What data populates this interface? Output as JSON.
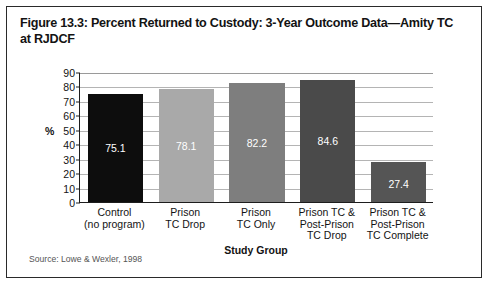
{
  "figure": {
    "title": "Figure 13.3: Percent Returned to Custody: 3-Year Outcome Data—Amity TC at RJDCF",
    "source_note": "Source: Lowe & Wexler, 1998"
  },
  "chart_data": {
    "type": "bar",
    "title": "Figure 13.3: Percent Returned to Custody: 3-Year Outcome Data—Amity TC at RJDCF",
    "categories": [
      "Control\n(no program)",
      "Prison\nTC Drop",
      "Prison\nTC Only",
      "Prison TC &\nPost-Prison\nTC Drop",
      "Prison TC &\nPost-Prison\nTC Complete"
    ],
    "category_lines": [
      [
        "Control",
        "(no program)"
      ],
      [
        "Prison",
        "TC Drop"
      ],
      [
        "Prison",
        "TC Only"
      ],
      [
        "Prison TC &",
        "Post-Prison",
        "TC Drop"
      ],
      [
        "Prison TC &",
        "Post-Prison",
        "TC Complete"
      ]
    ],
    "values": [
      75.1,
      78.1,
      82.2,
      84.6,
      27.4
    ],
    "value_labels": [
      "75.1",
      "78.1",
      "82.2",
      "84.6",
      "27.4"
    ],
    "bar_colors": [
      "#0d0d0d",
      "#a9a9a9",
      "#7e7e7e",
      "#4a4a4a",
      "#555555"
    ],
    "xlabel": "Study Group",
    "ylabel": "%",
    "ylim": [
      0,
      90
    ],
    "yticks": [
      0,
      10,
      20,
      30,
      40,
      50,
      60,
      70,
      80,
      90
    ],
    "ytick_labels": [
      "0",
      "10",
      "20",
      "30",
      "40",
      "50",
      "60",
      "70",
      "80",
      "90"
    ],
    "grid": true,
    "grid_axis": "y",
    "legend": false
  }
}
